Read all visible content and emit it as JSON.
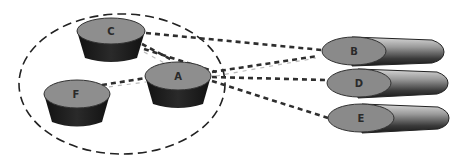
{
  "diagram": {
    "group": {
      "shape": "dashed-ellipse"
    },
    "local_nodes": [
      {
        "id": "C",
        "label": "C"
      },
      {
        "id": "A",
        "label": "A"
      },
      {
        "id": "F",
        "label": "F"
      }
    ],
    "remote_nodes": [
      {
        "id": "B",
        "label": "B"
      },
      {
        "id": "D",
        "label": "D"
      },
      {
        "id": "E",
        "label": "E"
      }
    ],
    "connections": [
      {
        "from": "C",
        "to": "B"
      },
      {
        "from": "C",
        "to": "A"
      },
      {
        "from": "C",
        "to": "D"
      },
      {
        "from": "F",
        "to": "A"
      },
      {
        "from": "A",
        "to": "B"
      },
      {
        "from": "A",
        "to": "D"
      },
      {
        "from": "A",
        "to": "E"
      }
    ],
    "colors": {
      "node_top": "#8c8c8c",
      "node_body": "#1e1e1e",
      "line": "#333333"
    }
  }
}
